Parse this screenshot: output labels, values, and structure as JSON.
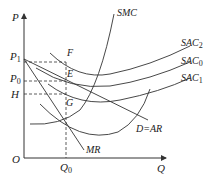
{
  "diagram": {
    "type": "economics cost/revenue diagram",
    "axes": {
      "y_label": "P",
      "x_label": "Q",
      "origin_label": "O"
    },
    "y_ticks": [
      {
        "base": "P",
        "sub": "1"
      },
      {
        "base": "P",
        "sub": "0"
      },
      {
        "base": "H",
        "sub": ""
      }
    ],
    "x_ticks": [
      {
        "base": "Q",
        "sub": "0"
      }
    ],
    "curves": [
      {
        "base": "SMC",
        "sub": ""
      },
      {
        "base": "SAC",
        "sub": "2"
      },
      {
        "base": "SAC",
        "sub": "0"
      },
      {
        "base": "SAC",
        "sub": "1"
      },
      {
        "base": "D=AR",
        "sub": ""
      },
      {
        "base": "MR",
        "sub": ""
      }
    ],
    "points": [
      "F",
      "E",
      "G"
    ],
    "colors": {
      "line": "#333333",
      "text": "#222222"
    }
  }
}
